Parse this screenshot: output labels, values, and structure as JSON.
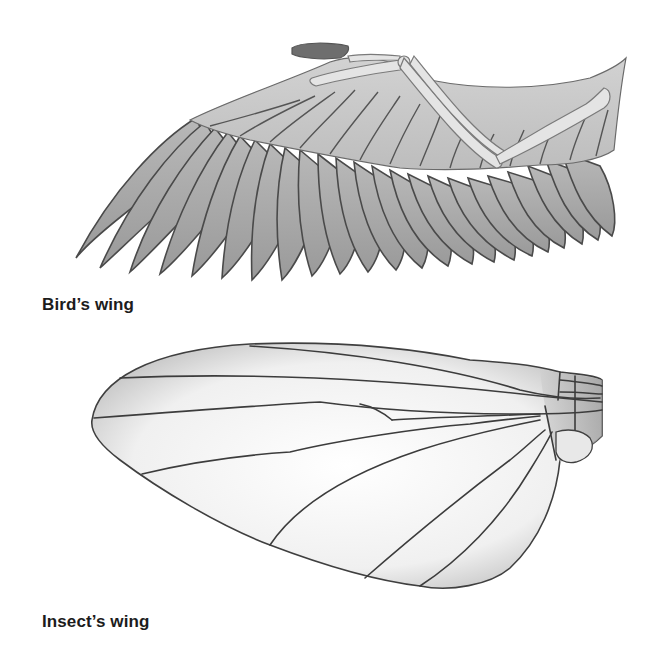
{
  "figure": {
    "panels": [
      {
        "id": "bird",
        "label": "Bird’s wing",
        "subject": "bird-wing-illustration",
        "fill_color": "#a9a9a9",
        "line_color": "#4a4a4a",
        "bone_color": "#e2e2e2"
      },
      {
        "id": "insect",
        "label": "Insect’s wing",
        "subject": "insect-wing-illustration",
        "fill_color": "#f4f4f4",
        "line_color": "#3f3f3f"
      }
    ],
    "background": "#ffffff"
  }
}
